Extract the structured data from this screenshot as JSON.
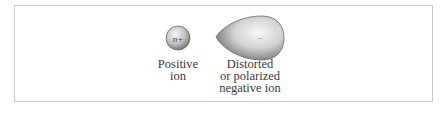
{
  "figure": {
    "positive_ion": {
      "symbol": "n+",
      "label_lines": [
        "Positive",
        "ion"
      ]
    },
    "negative_ion": {
      "symbol": "–",
      "label_lines": [
        "Distorted",
        "or polarized",
        "negative ion"
      ]
    }
  },
  "colors": {
    "frame_border": "#c8c8c8",
    "ion_light": "#f4f4f4",
    "ion_dark": "#7a7a7a",
    "text": "#3a3a3a"
  }
}
